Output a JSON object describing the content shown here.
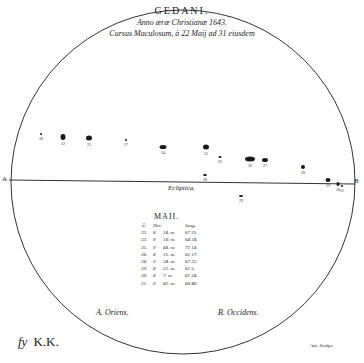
{
  "title": {
    "city": "GEDANI.",
    "line2": "Anno æræ Christianæ 1643.",
    "line3": "Cursus Maculosum, à 22 Maij ad 31 eiusdem"
  },
  "diagram": {
    "disc": {
      "cx": 183,
      "cy": 182,
      "r": 172,
      "stroke": "#333333"
    },
    "ecliptic_label": "Ecliptica.",
    "point_a": "A",
    "point_b": "B",
    "legend_a": "A. Oriens.",
    "legend_b": "B. Occidens.",
    "spots": [
      {
        "x": 41,
        "y": 134,
        "w": 1,
        "h": 1,
        "label": "28"
      },
      {
        "x": 63,
        "y": 137,
        "w": 5,
        "h": 6,
        "label": "22"
      },
      {
        "x": 89,
        "y": 138,
        "w": 6,
        "h": 5,
        "label": "23"
      },
      {
        "x": 126,
        "y": 140,
        "w": 1,
        "h": 1,
        "label": "27"
      },
      {
        "x": 163,
        "y": 147,
        "w": 7,
        "h": 4,
        "label": "24"
      },
      {
        "x": 206,
        "y": 147,
        "w": 6,
        "h": 5,
        "label": "25"
      },
      {
        "x": 220,
        "y": 157,
        "w": 3,
        "h": 2,
        "label": "26"
      },
      {
        "x": 250,
        "y": 159,
        "w": 10,
        "h": 5,
        "label": "26"
      },
      {
        "x": 265,
        "y": 160,
        "w": 6,
        "h": 4,
        "label": "27"
      },
      {
        "x": 303,
        "y": 167,
        "w": 4,
        "h": 4,
        "label": "28"
      },
      {
        "x": 328,
        "y": 180,
        "w": 5,
        "h": 4,
        "label": "29"
      },
      {
        "x": 338,
        "y": 184,
        "w": 3,
        "h": 4,
        "label": "30"
      },
      {
        "x": 205,
        "y": 175,
        "w": 4,
        "h": 2,
        "label": "28"
      },
      {
        "x": 241,
        "y": 196,
        "w": 4,
        "h": 2,
        "label": "29"
      },
      {
        "x": 342,
        "y": 186,
        "w": 1,
        "h": 1,
        "label": "31"
      }
    ]
  },
  "table": {
    "heading": "MAII.",
    "columns": [
      "☉",
      "Hor.",
      "",
      "Sexg."
    ],
    "rows": [
      [
        "22.",
        "8",
        "24. m.",
        "67 25."
      ],
      [
        "23.",
        "9",
        "10. m.",
        "64 34."
      ],
      [
        "25.",
        "9",
        "44. m.",
        "72 14."
      ],
      [
        "26.",
        "8",
        "15. m.",
        "65 17."
      ],
      [
        "28.",
        "9",
        "24. m.",
        "67 22."
      ],
      [
        "29.",
        "8",
        "22. m.",
        "62 5."
      ],
      [
        "30.",
        "8",
        "7. m.",
        "62 24."
      ],
      [
        "31.",
        "9",
        "42. m.",
        "60 40."
      ]
    ]
  },
  "signature": {
    "fy": "fy",
    "initials": "K.K.",
    "engraver": "Aut. Sculps."
  }
}
